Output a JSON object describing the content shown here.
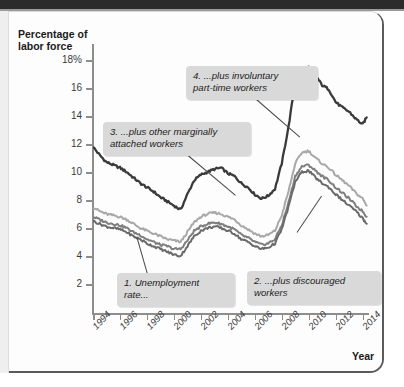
{
  "figure": {
    "y_axis_title_line1": "Percentage of",
    "y_axis_title_line2": "labor force",
    "x_axis_title": "Year"
  },
  "annotations": [
    {
      "id": "callout-1",
      "line1": "1. Unemployment",
      "line2": "rate..."
    },
    {
      "id": "callout-2",
      "line1": "2. ...plus discouraged",
      "line2": "workers"
    },
    {
      "id": "callout-3",
      "line1": "3. ...plus other marginally",
      "line2": "attached workers"
    },
    {
      "id": "callout-4",
      "line1": "4. ...plus involuntary",
      "line2": "part-time workers"
    }
  ],
  "colors": {
    "series_u6": "#3a3a3a",
    "series_marginal": "#a8a8a8",
    "series_discouraged": "#7e7e7e",
    "series_unemployment": "#6a6a6a",
    "axis": "#8d8d8d",
    "callout_bg": "#d9d9d9",
    "page": "#fdfdfd"
  },
  "chart_data": {
    "type": "line",
    "title": "",
    "xlabel": "Year",
    "ylabel": "Percentage of labor force",
    "xlim": [
      1994,
      2014.4
    ],
    "ylim": [
      0,
      19
    ],
    "grid": false,
    "legend": "none (inline callouts)",
    "yticks": [
      2,
      4,
      6,
      8,
      10,
      12,
      14,
      16,
      18
    ],
    "ytick_labels": [
      "2",
      "4",
      "6",
      "8",
      "10",
      "12",
      "14",
      "16",
      "18%"
    ],
    "xticks": [
      1994,
      1996,
      1998,
      2000,
      2002,
      2004,
      2006,
      2008,
      2010,
      2012,
      2014
    ],
    "xtick_labels": [
      "1994",
      "1996",
      "1998",
      "2000",
      "2002",
      "2004",
      "2006",
      "2008",
      "2010",
      "2012",
      "2014"
    ],
    "x": [
      1994.0,
      1994.5,
      1995.0,
      1995.5,
      1996.0,
      1996.5,
      1997.0,
      1997.5,
      1998.0,
      1998.5,
      1999.0,
      1999.5,
      2000.0,
      2000.5,
      2001.0,
      2001.5,
      2002.0,
      2002.5,
      2003.0,
      2003.5,
      2004.0,
      2004.5,
      2005.0,
      2005.5,
      2006.0,
      2006.5,
      2007.0,
      2007.5,
      2008.0,
      2008.5,
      2009.0,
      2009.5,
      2010.0,
      2010.5,
      2011.0,
      2011.5,
      2012.0,
      2012.5,
      2013.0,
      2013.5,
      2014.0,
      2014.3
    ],
    "series": [
      {
        "name": "4. ...plus involuntary part-time workers (U-6)",
        "color": "#3a3a3a",
        "values": [
          11.8,
          11.2,
          10.7,
          10.5,
          10.3,
          10.0,
          9.6,
          9.2,
          8.9,
          8.6,
          8.2,
          7.9,
          7.6,
          7.3,
          8.4,
          9.4,
          9.8,
          10.0,
          10.2,
          10.3,
          9.9,
          9.7,
          9.2,
          8.9,
          8.4,
          8.1,
          8.3,
          8.8,
          10.6,
          13.2,
          16.4,
          17.2,
          17.5,
          16.9,
          16.2,
          15.9,
          15.0,
          14.6,
          14.3,
          13.8,
          13.4,
          13.9
        ]
      },
      {
        "name": "3. ...plus other marginally attached workers",
        "color": "#a8a8a8",
        "values": [
          7.5,
          7.2,
          7.0,
          6.9,
          6.8,
          6.6,
          6.3,
          6.0,
          5.8,
          5.6,
          5.4,
          5.2,
          5.1,
          5.0,
          5.7,
          6.4,
          6.8,
          7.0,
          7.1,
          7.0,
          6.8,
          6.6,
          6.2,
          5.9,
          5.6,
          5.4,
          5.5,
          5.8,
          6.9,
          8.6,
          10.6,
          11.4,
          11.5,
          11.0,
          10.6,
          10.3,
          9.8,
          9.4,
          9.0,
          8.5,
          8.1,
          7.6
        ]
      },
      {
        "name": "2. ...plus discouraged workers",
        "color": "#7e7e7e",
        "values": [
          6.8,
          6.6,
          6.4,
          6.3,
          6.2,
          6.0,
          5.7,
          5.5,
          5.2,
          5.0,
          4.8,
          4.7,
          4.5,
          4.5,
          5.1,
          5.8,
          6.1,
          6.3,
          6.4,
          6.3,
          6.1,
          5.9,
          5.5,
          5.3,
          5.0,
          4.8,
          4.9,
          5.2,
          6.2,
          7.8,
          9.7,
          10.4,
          10.5,
          10.1,
          9.7,
          9.4,
          8.9,
          8.5,
          8.1,
          7.6,
          7.2,
          6.8
        ]
      },
      {
        "name": "1. Unemployment rate",
        "color": "#6a6a6a",
        "values": [
          6.5,
          6.3,
          6.1,
          6.0,
          5.9,
          5.7,
          5.4,
          5.2,
          4.9,
          4.7,
          4.5,
          4.3,
          4.1,
          4.0,
          4.7,
          5.4,
          5.8,
          6.0,
          6.1,
          6.0,
          5.8,
          5.6,
          5.2,
          5.0,
          4.7,
          4.5,
          4.6,
          4.9,
          5.9,
          7.5,
          9.3,
          10.0,
          10.1,
          9.6,
          9.2,
          8.9,
          8.4,
          8.0,
          7.6,
          7.2,
          6.7,
          6.3
        ]
      }
    ]
  }
}
